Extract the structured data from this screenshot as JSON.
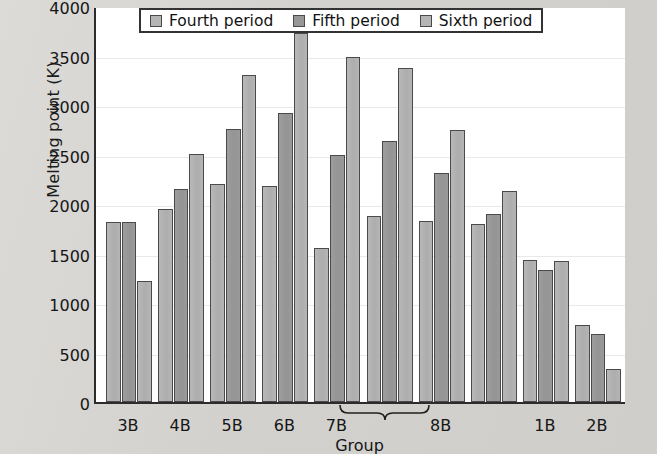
{
  "chart_data": {
    "type": "bar",
    "title": "",
    "xlabel": "Group",
    "ylabel": "Melting point (K)",
    "ylim": [
      0,
      4000
    ],
    "ytick_step": 500,
    "yticks": [
      0,
      500,
      1000,
      1500,
      2000,
      2500,
      3000,
      3500,
      4000
    ],
    "ytick_labels": [
      "0",
      "500",
      "1000",
      "1500",
      "2000",
      "2500",
      "3000",
      "3500",
      "4000"
    ],
    "grid": true,
    "legend_position": "top-center",
    "categories": [
      "3B",
      "4B",
      "5B",
      "6B",
      "7B",
      "8B",
      "8B",
      "8B",
      "1B",
      "2B"
    ],
    "axis_group_labels": [
      "3B",
      "4B",
      "5B",
      "6B",
      "7B",
      "8B",
      "1B",
      "2B"
    ],
    "bracket_label": "8B",
    "bracket_spans_clusters": 3,
    "series": [
      {
        "name": "Fourth period",
        "color": "#b5b5b5",
        "values": [
          1820,
          1950,
          2200,
          2180,
          1560,
          1880,
          1830,
          1800,
          1430,
          780
        ]
      },
      {
        "name": "Fifth period",
        "color": "#979797",
        "values": [
          1820,
          2150,
          2760,
          2920,
          2500,
          2640,
          2310,
          1900,
          1330,
          690
        ]
      },
      {
        "name": "Sixth period",
        "color": "#b5b5b5",
        "values": [
          1220,
          2510,
          3300,
          3730,
          3490,
          3370,
          2750,
          2130,
          1420,
          330
        ]
      }
    ]
  },
  "legend": {
    "entries": [
      {
        "label": "Fourth period"
      },
      {
        "label": "Fifth period"
      },
      {
        "label": "Sixth period"
      }
    ]
  }
}
